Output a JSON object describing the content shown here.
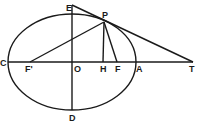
{
  "diagram": {
    "type": "ellipse-tangent-construction",
    "stroke_color": "#1a1a1a",
    "background": "#ffffff",
    "ellipse": {
      "cx": 72,
      "cy": 62,
      "rx": 64,
      "ry": 48
    },
    "points": {
      "E": {
        "label": "E",
        "x": 72,
        "y": 5
      },
      "P": {
        "label": "P",
        "x": 104,
        "y": 22
      },
      "C": {
        "label": "C",
        "x": 8,
        "y": 62
      },
      "F_prime": {
        "label": "F'",
        "x": 30,
        "y": 62
      },
      "O": {
        "label": "O",
        "x": 72,
        "y": 62
      },
      "H": {
        "label": "H",
        "x": 103,
        "y": 62
      },
      "F": {
        "label": "F",
        "x": 117,
        "y": 62
      },
      "A": {
        "label": "A",
        "x": 136,
        "y": 62
      },
      "T": {
        "label": "T",
        "x": 193,
        "y": 62
      },
      "D": {
        "label": "D",
        "x": 72,
        "y": 110
      }
    },
    "segments": [
      [
        "C",
        "T"
      ],
      [
        "E",
        "D"
      ],
      [
        "E",
        "T"
      ],
      [
        "F_prime",
        "P"
      ],
      [
        "P",
        "H"
      ],
      [
        "P",
        "F"
      ]
    ]
  }
}
